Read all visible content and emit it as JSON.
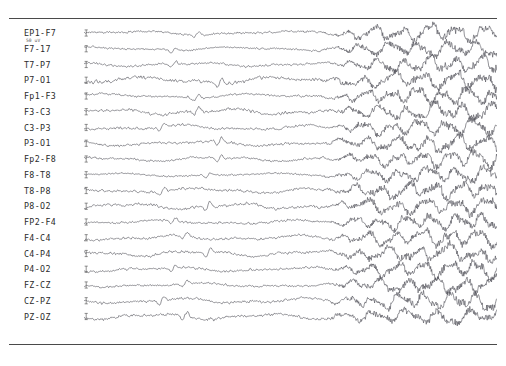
{
  "figure": {
    "background_color": "#ffffff",
    "frame_color": "#4a4a4a",
    "trace_color": "#4f4f57",
    "scale_annotation": "50 uV"
  },
  "chart_data": {
    "type": "line",
    "title": "",
    "subtitle": "",
    "xlabel": "",
    "ylabel": "",
    "grid": false,
    "legend_position": "left-labels",
    "xlim": [
      0,
      1
    ],
    "ylim": [
      -1,
      1
    ],
    "annotations": [
      "50 uV"
    ],
    "seizure_onset_fraction": 0.615,
    "channel_count": 20,
    "categories": [
      "EP1-F7",
      "F7-17",
      "T7-P7",
      "P7-O1",
      "Fp1-F3",
      "F3-C3",
      "C3-P3",
      "P3-O1",
      "Fp2-F8",
      "F8-T8",
      "T8-P8",
      "P8-O2",
      "FP2-F4",
      "F4-C4",
      "C4-P4",
      "P4-O2",
      "FZ-CZ",
      "CZ-PZ",
      "PZ-OZ"
    ],
    "series": [
      {
        "name": "EP1-F7",
        "seed": 11,
        "baseline_amp": 0.21,
        "ictal_amp": 0.95,
        "baseline_freq": 2.6,
        "ictal_freq": 15.0
      },
      {
        "name": "F7-17",
        "seed": 23,
        "baseline_amp": 0.18,
        "ictal_amp": 0.9,
        "baseline_freq": 2.9,
        "ictal_freq": 14.2
      },
      {
        "name": "T7-P7",
        "seed": 37,
        "baseline_amp": 0.2,
        "ictal_amp": 0.88,
        "baseline_freq": 3.2,
        "ictal_freq": 15.8
      },
      {
        "name": "P7-O1",
        "seed": 41,
        "baseline_amp": 0.34,
        "ictal_amp": 1.0,
        "baseline_freq": 3.0,
        "ictal_freq": 13.6
      },
      {
        "name": "Fp1-F3",
        "seed": 53,
        "baseline_amp": 0.22,
        "ictal_amp": 0.92,
        "baseline_freq": 2.7,
        "ictal_freq": 16.4
      },
      {
        "name": "F3-C3",
        "seed": 67,
        "baseline_amp": 0.3,
        "ictal_amp": 0.96,
        "baseline_freq": 3.6,
        "ictal_freq": 14.8
      },
      {
        "name": "C3-P3",
        "seed": 71,
        "baseline_amp": 0.24,
        "ictal_amp": 0.89,
        "baseline_freq": 3.1,
        "ictal_freq": 15.2
      },
      {
        "name": "P3-O1",
        "seed": 83,
        "baseline_amp": 0.26,
        "ictal_amp": 0.94,
        "baseline_freq": 2.8,
        "ictal_freq": 13.9
      },
      {
        "name": "Fp2-F8",
        "seed": 97,
        "baseline_amp": 0.23,
        "ictal_amp": 0.91,
        "baseline_freq": 3.3,
        "ictal_freq": 16.0
      },
      {
        "name": "F8-T8",
        "seed": 103,
        "baseline_amp": 0.17,
        "ictal_amp": 0.86,
        "baseline_freq": 2.5,
        "ictal_freq": 14.5
      },
      {
        "name": "T8-P8",
        "seed": 113,
        "baseline_amp": 0.25,
        "ictal_amp": 0.93,
        "baseline_freq": 3.4,
        "ictal_freq": 15.5
      },
      {
        "name": "P8-O2",
        "seed": 131,
        "baseline_amp": 0.28,
        "ictal_amp": 0.97,
        "baseline_freq": 3.8,
        "ictal_freq": 14.0
      },
      {
        "name": "FP2-F4",
        "seed": 149,
        "baseline_amp": 0.21,
        "ictal_amp": 0.9,
        "baseline_freq": 2.9,
        "ictal_freq": 16.2
      },
      {
        "name": "F4-C4",
        "seed": 157,
        "baseline_amp": 0.24,
        "ictal_amp": 0.92,
        "baseline_freq": 3.2,
        "ictal_freq": 15.1
      },
      {
        "name": "C4-P4",
        "seed": 173,
        "baseline_amp": 0.27,
        "ictal_amp": 0.95,
        "baseline_freq": 3.5,
        "ictal_freq": 13.8
      },
      {
        "name": "P4-O2",
        "seed": 191,
        "baseline_amp": 0.23,
        "ictal_amp": 0.91,
        "baseline_freq": 3.0,
        "ictal_freq": 15.6
      },
      {
        "name": "FZ-CZ",
        "seed": 199,
        "baseline_amp": 0.2,
        "ictal_amp": 0.88,
        "baseline_freq": 2.7,
        "ictal_freq": 14.7
      },
      {
        "name": "CZ-PZ",
        "seed": 211,
        "baseline_amp": 0.26,
        "ictal_amp": 0.94,
        "baseline_freq": 3.3,
        "ictal_freq": 16.1
      },
      {
        "name": "PZ-OZ",
        "seed": 227,
        "baseline_amp": 0.29,
        "ictal_amp": 0.87,
        "baseline_freq": 3.6,
        "ictal_freq": 12.9
      }
    ]
  },
  "channels": [
    {
      "label": "EP1-F7",
      "row": 0
    },
    {
      "label": "F7-17",
      "row": 1
    },
    {
      "label": "T7-P7",
      "row": 2
    },
    {
      "label": "P7-O1",
      "row": 3
    },
    {
      "label": "Fp1-F3",
      "row": 4
    },
    {
      "label": "F3-C3",
      "row": 5
    },
    {
      "label": "C3-P3",
      "row": 6
    },
    {
      "label": "P3-O1",
      "row": 7
    },
    {
      "label": "Fp2-F8",
      "row": 8
    },
    {
      "label": "F8-T8",
      "row": 9
    },
    {
      "label": "T8-P8",
      "row": 10
    },
    {
      "label": "P8-O2",
      "row": 11
    },
    {
      "label": "FP2-F4",
      "row": 12
    },
    {
      "label": "F4-C4",
      "row": 13
    },
    {
      "label": "C4-P4",
      "row": 14
    },
    {
      "label": "P4-O2",
      "row": 15
    },
    {
      "label": "FZ-CZ",
      "row": 16
    },
    {
      "label": "CZ-PZ",
      "row": 17
    },
    {
      "label": "PZ-OZ",
      "row": 18
    }
  ]
}
